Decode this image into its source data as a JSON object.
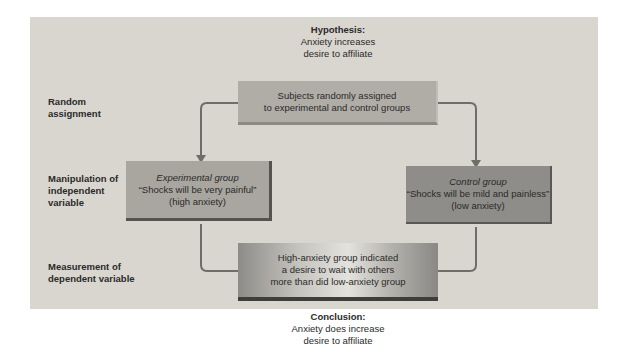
{
  "hypothesis": {
    "heading": "Hypothesis:",
    "line1": "Anxiety increases",
    "line2": "desire to affiliate"
  },
  "row_labels": {
    "random_assignment": {
      "line1": "Random",
      "line2": "assignment"
    },
    "manipulation": {
      "line1": "Manipulation of",
      "line2": "independent",
      "line3": "variable"
    },
    "measurement": {
      "line1": "Measurement of",
      "line2": "dependent variable"
    }
  },
  "boxes": {
    "assignment": {
      "line1": "Subjects randomly assigned",
      "line2": "to experimental and control groups"
    },
    "experimental": {
      "title": "Experimental group",
      "line1": "“Shocks will be very painful”",
      "line2": "(high anxiety)"
    },
    "control": {
      "title": "Control group",
      "line1": "“Shocks will be mild and painless”",
      "line2": "(low anxiety)"
    },
    "result": {
      "line1": "High-anxiety group indicated",
      "line2": "a desire to wait with others",
      "line3": "more than did low-anxiety group"
    }
  },
  "conclusion": {
    "heading": "Conclusion:",
    "line1": "Anxiety does increase",
    "line2": "desire to affiliate"
  },
  "colors": {
    "panel": "#d9d6cf",
    "arrow": "#6f6d69"
  }
}
